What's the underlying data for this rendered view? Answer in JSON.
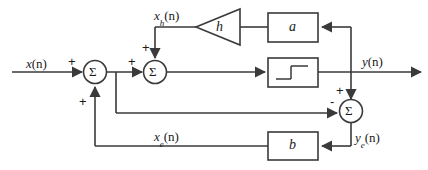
{
  "diagram": {
    "type": "block-diagram",
    "canvas": {
      "width": 428,
      "height": 170
    },
    "stroke_color": "#3a3a3a",
    "text_color": "#1a1a1a",
    "background": "#ffffff",
    "signals": {
      "input": {
        "base": "x",
        "sub": "",
        "arg": "(n)"
      },
      "hidden": {
        "base": "x",
        "sub": "h",
        "arg": "(n)"
      },
      "output": {
        "base": "y",
        "sub": "",
        "arg": "(n)"
      },
      "error_x": {
        "base": "x",
        "sub": "e",
        "arg": "(n)"
      },
      "error_y": {
        "base": "y",
        "sub": "e",
        "arg": "(n)"
      }
    },
    "blocks": [
      {
        "id": "gain-h",
        "label": "h",
        "shape": "triangle"
      },
      {
        "id": "gain-a",
        "label": "a",
        "shape": "rect"
      },
      {
        "id": "gain-b",
        "label": "b",
        "shape": "rect"
      },
      {
        "id": "relay",
        "label": "",
        "shape": "rect",
        "symbol": "hysteresis-step"
      }
    ],
    "summers": [
      {
        "id": "sum-1",
        "glyph": "Σ",
        "signs": [
          "+",
          "+"
        ]
      },
      {
        "id": "sum-2",
        "glyph": "Σ",
        "signs": [
          "+",
          "+"
        ]
      },
      {
        "id": "sum-3",
        "glyph": "Σ",
        "signs": [
          "+",
          "-"
        ]
      }
    ],
    "sign_marks": {
      "sum1_input": "+",
      "sum1_bottom": "+",
      "sum2_left": "+",
      "sum2_top": "+",
      "sum3_top": "+",
      "sum3_left": "-"
    }
  }
}
